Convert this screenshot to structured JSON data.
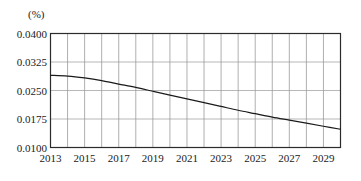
{
  "chart_data": {
    "type": "line",
    "title": "",
    "subtitle": "",
    "xlabel": "",
    "ylabel": "",
    "unit_label": "(%)",
    "grid": true,
    "legend": null,
    "xlim": [
      2013,
      2030
    ],
    "ylim": [
      0.01,
      0.04
    ],
    "ytick_labels": [
      "0.0400",
      "0.0325",
      "0.0250",
      "0.0175",
      "0.0100"
    ],
    "ytick_values": [
      0.04,
      0.0325,
      0.025,
      0.0175,
      0.01
    ],
    "xtick_labels": [
      "2013",
      "2015",
      "2017",
      "2019",
      "2021",
      "2023",
      "2025",
      "2027",
      "2029"
    ],
    "xtick_values": [
      2013,
      2015,
      2017,
      2019,
      2021,
      2023,
      2025,
      2027,
      2029
    ],
    "x_gridline_values": [
      2013,
      2014,
      2015,
      2016,
      2017,
      2018,
      2019,
      2020,
      2021,
      2022,
      2023,
      2024,
      2025,
      2026,
      2027,
      2028,
      2029,
      2030
    ],
    "series": [
      {
        "name": "rate",
        "color": "#1a1a1a",
        "x": [
          2013,
          2014,
          2015,
          2016,
          2017,
          2018,
          2019,
          2020,
          2021,
          2022,
          2023,
          2024,
          2025,
          2026,
          2027,
          2028,
          2029,
          2030
        ],
        "values": [
          0.029,
          0.0288,
          0.0283,
          0.0276,
          0.0267,
          0.0258,
          0.0248,
          0.0238,
          0.0228,
          0.0218,
          0.0208,
          0.0198,
          0.0189,
          0.018,
          0.0172,
          0.0164,
          0.0156,
          0.0148
        ]
      }
    ]
  }
}
